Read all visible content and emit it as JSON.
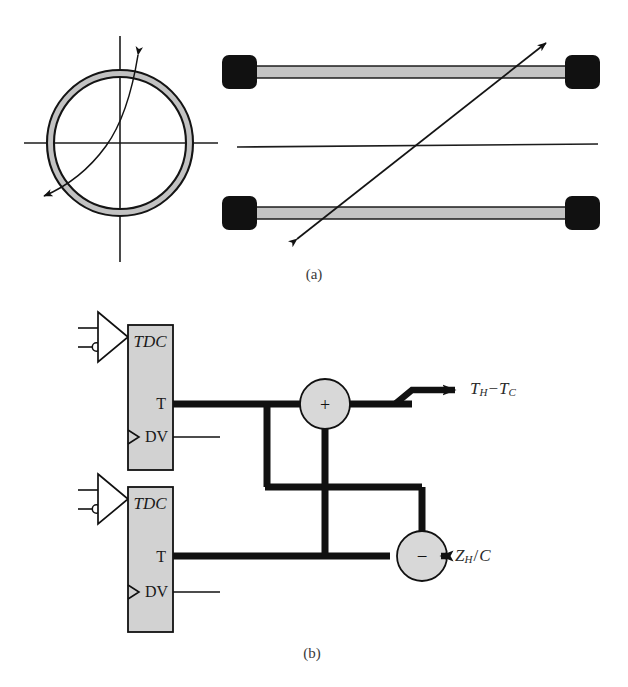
{
  "figure": {
    "background_color": "#ffffff",
    "ink_color": "#111111",
    "fill_gray": "#c9c9c9",
    "block_gray": "#d2d2d2"
  },
  "panel_a": {
    "caption": "(a)",
    "ring": {
      "name": "annulus-ring",
      "center_x": 120,
      "center_y": 143,
      "outer_radius": 73,
      "inner_radius": 66,
      "fill": "#c4c4c4",
      "stroke": "#111111"
    },
    "axes": {
      "vertical_label": "vertical-axis",
      "horizontal_label": "horizontal-axis"
    },
    "curved_arrow": {
      "name": "rotation-double-arrow",
      "description": "curved double-headed arrow through ring center"
    },
    "rods": [
      {
        "name": "rod-top",
        "x1": 222,
        "x2": 600,
        "y": 72,
        "cap_color": "#111111",
        "bar_color": "#c4c4c4"
      },
      {
        "name": "rod-bottom",
        "x1": 222,
        "x2": 600,
        "y": 213,
        "cap_color": "#111111",
        "bar_color": "#c4c4c4"
      }
    ],
    "center_line": {
      "name": "center-reference-line",
      "x1": 237,
      "x2": 598,
      "y": 146
    },
    "diagonal_arrow": {
      "name": "diagonal-double-arrow",
      "x1": 296,
      "y1": 239,
      "x2": 545,
      "y2": 43
    }
  },
  "panel_b": {
    "caption": "(b)",
    "blocks": [
      {
        "name": "tdc-block-top",
        "label": "TDC",
        "ports": [
          {
            "name": "port-t",
            "label": "T"
          },
          {
            "name": "port-dv",
            "label": "DV"
          }
        ]
      },
      {
        "name": "tdc-block-bottom",
        "label": "TDC",
        "ports": [
          {
            "name": "port-t",
            "label": "T"
          },
          {
            "name": "port-dv",
            "label": "DV"
          }
        ]
      }
    ],
    "operators": [
      {
        "name": "adder-node",
        "symbol": "+"
      },
      {
        "name": "subtractor-node",
        "symbol": "−"
      }
    ],
    "outputs": [
      {
        "name": "output-th-minus-tc",
        "base": "T",
        "sub1": "H",
        "operator": "−",
        "base2": "T",
        "sub2": "C"
      },
      {
        "name": "output-zh-over-c",
        "base": "Z",
        "sub1": "H",
        "operator": "/",
        "base2": "C",
        "sub2": ""
      }
    ],
    "buffers": [
      {
        "name": "differential-buffer-top",
        "has_inverting_bubble": true
      },
      {
        "name": "differential-buffer-bottom",
        "has_inverting_bubble": true
      }
    ]
  }
}
